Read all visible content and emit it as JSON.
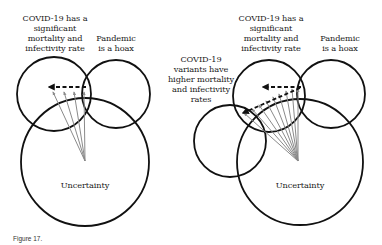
{
  "figure": {
    "caption": "Figure 17."
  },
  "colors": {
    "circle_stroke": "#111111",
    "dashed_arrow": "#111111",
    "gray_arrows": "#8a8a8a",
    "text": "#1a1a1a",
    "background": "#ffffff"
  },
  "left_diagram": {
    "labels": {
      "covid": [
        "COVID-19 has a",
        "significant",
        "mortality and",
        "infectivity rate"
      ],
      "hoax": [
        "Pandemic",
        "is a hoax"
      ],
      "uncertainty": "Uncertainty"
    },
    "circles": [
      {
        "name": "covid",
        "cx": 54,
        "cy": 94,
        "r": 37
      },
      {
        "name": "hoax",
        "cx": 116,
        "cy": 94,
        "r": 34
      },
      {
        "name": "uncertainty",
        "cx": 85,
        "cy": 162,
        "r": 64
      }
    ],
    "gray_arrow_count": 4
  },
  "right_diagram": {
    "labels": {
      "covid": [
        "COVID-19 has a",
        "significant",
        "mortality and",
        "infectivity rate"
      ],
      "hoax": [
        "Pandemic",
        "is a hoax"
      ],
      "variants": [
        "COVID-19",
        "variants have",
        "higher mortality",
        "and infectivity",
        "rates"
      ],
      "uncertainty": "Uncertainty"
    },
    "circles": [
      {
        "name": "covid",
        "cx": 269,
        "cy": 96,
        "r": 36
      },
      {
        "name": "hoax",
        "cx": 331,
        "cy": 94,
        "r": 34
      },
      {
        "name": "variants",
        "cx": 230,
        "cy": 141,
        "r": 36
      },
      {
        "name": "uncertainty",
        "cx": 300,
        "cy": 162,
        "r": 63
      }
    ],
    "gray_arrow_count": 9
  }
}
